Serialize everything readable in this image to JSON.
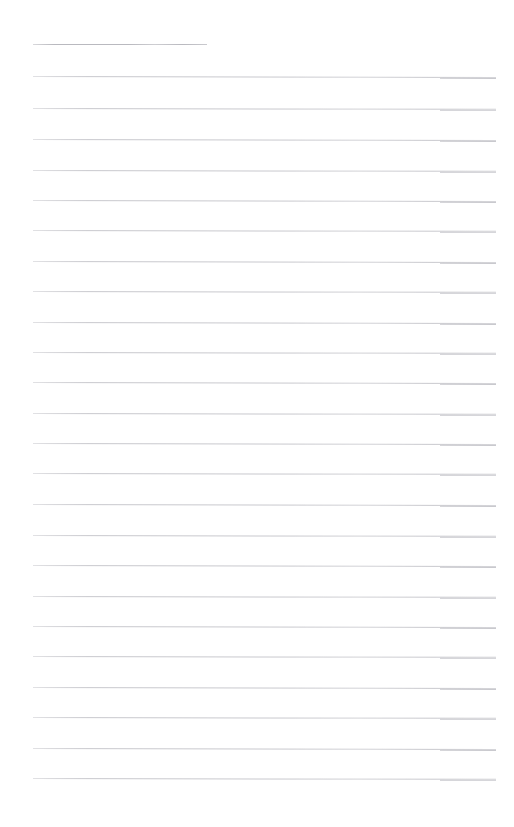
{
  "page": {
    "kind": "scanned-blank-ruled-paper",
    "width": 514,
    "height": 827,
    "background_color": "#ffffff",
    "visible_text": "",
    "note": "Blank lined notebook page. No text, headings, numbers or icons are rendered anywhere in the image."
  },
  "ruling": {
    "line_color": "#c9c9ce",
    "header_line_color": "#b9b9bf",
    "line_thickness_px": 1,
    "line_spacing_px": 30.4,
    "left_margin_px": 33,
    "right_edge_px": 496,
    "header_rule_right_edge_px": 207,
    "first_line_y_px": 44,
    "last_line_y_px": 778,
    "line_count": 25,
    "scan_step_x_px": 440
  },
  "lines": [
    {
      "index": 0,
      "y": 44,
      "x1": 33,
      "x2": 207,
      "header": true,
      "tilt_deg": 0.0
    },
    {
      "index": 1,
      "y": 76,
      "x1": 33,
      "x2": 496,
      "header": false,
      "tilt_deg": 0.12
    },
    {
      "index": 2,
      "y": 108,
      "x1": 33,
      "x2": 496,
      "header": false,
      "tilt_deg": 0.1
    },
    {
      "index": 3,
      "y": 139,
      "x1": 33,
      "x2": 496,
      "header": false,
      "tilt_deg": 0.12
    },
    {
      "index": 4,
      "y": 170,
      "x1": 33,
      "x2": 496,
      "header": false,
      "tilt_deg": 0.1
    },
    {
      "index": 5,
      "y": 200,
      "x1": 33,
      "x2": 496,
      "header": false,
      "tilt_deg": 0.11
    },
    {
      "index": 6,
      "y": 230,
      "x1": 33,
      "x2": 496,
      "header": false,
      "tilt_deg": 0.1
    },
    {
      "index": 7,
      "y": 261,
      "x1": 33,
      "x2": 496,
      "header": false,
      "tilt_deg": 0.12
    },
    {
      "index": 8,
      "y": 291,
      "x1": 33,
      "x2": 496,
      "header": false,
      "tilt_deg": 0.1
    },
    {
      "index": 9,
      "y": 322,
      "x1": 33,
      "x2": 496,
      "header": false,
      "tilt_deg": 0.11
    },
    {
      "index": 10,
      "y": 352,
      "x1": 33,
      "x2": 496,
      "header": false,
      "tilt_deg": 0.1
    },
    {
      "index": 11,
      "y": 382,
      "x1": 33,
      "x2": 496,
      "header": false,
      "tilt_deg": 0.12
    },
    {
      "index": 12,
      "y": 413,
      "x1": 33,
      "x2": 496,
      "header": false,
      "tilt_deg": 0.1
    },
    {
      "index": 13,
      "y": 443,
      "x1": 33,
      "x2": 496,
      "header": false,
      "tilt_deg": 0.11
    },
    {
      "index": 14,
      "y": 473,
      "x1": 33,
      "x2": 496,
      "header": false,
      "tilt_deg": 0.1
    },
    {
      "index": 15,
      "y": 504,
      "x1": 33,
      "x2": 496,
      "header": false,
      "tilt_deg": 0.12
    },
    {
      "index": 16,
      "y": 535,
      "x1": 33,
      "x2": 496,
      "header": false,
      "tilt_deg": 0.1
    },
    {
      "index": 17,
      "y": 565,
      "x1": 33,
      "x2": 496,
      "header": false,
      "tilt_deg": 0.11
    },
    {
      "index": 18,
      "y": 596,
      "x1": 33,
      "x2": 496,
      "header": false,
      "tilt_deg": 0.1
    },
    {
      "index": 19,
      "y": 626,
      "x1": 33,
      "x2": 496,
      "header": false,
      "tilt_deg": 0.12
    },
    {
      "index": 20,
      "y": 656,
      "x1": 33,
      "x2": 496,
      "header": false,
      "tilt_deg": 0.1
    },
    {
      "index": 21,
      "y": 687,
      "x1": 33,
      "x2": 496,
      "header": false,
      "tilt_deg": 0.11
    },
    {
      "index": 22,
      "y": 717,
      "x1": 33,
      "x2": 496,
      "header": false,
      "tilt_deg": 0.1
    },
    {
      "index": 23,
      "y": 748,
      "x1": 33,
      "x2": 496,
      "header": false,
      "tilt_deg": 0.12
    },
    {
      "index": 24,
      "y": 778,
      "x1": 33,
      "x2": 496,
      "header": false,
      "tilt_deg": 0.1
    }
  ]
}
